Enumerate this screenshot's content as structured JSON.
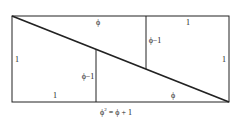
{
  "diagram": {
    "colors": {
      "stroke": "#222222",
      "background": "#ffffff"
    },
    "labels": {
      "top_phi": "ϕ",
      "top_right_one": "1",
      "upper_phi_minus_one": "ϕ−1",
      "left_one": "1",
      "lower_phi_minus_one": "ϕ−1",
      "right_one": "1",
      "bottom_left_one": "1",
      "bottom_phi": "ϕ"
    },
    "caption": {
      "lhs_base": "ϕ",
      "lhs_exponent": "2",
      "rhs": " = ϕ + 1"
    }
  }
}
